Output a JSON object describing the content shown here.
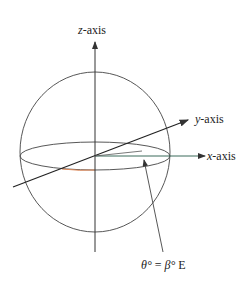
{
  "diagram": {
    "type": "sphere-coordinate-axes",
    "labels": {
      "z_axis_var": "z",
      "z_axis_suffix": "-axis",
      "y_axis_var": "y",
      "y_axis_suffix": "-axis",
      "x_axis_var": "x",
      "x_axis_suffix": "-axis",
      "angle_theta": "θ°",
      "equals": " = ",
      "angle_beta": "β°",
      "east": " E"
    },
    "colors": {
      "line": "#333333",
      "x_axis": "#3a6b5a",
      "equator_highlight": "#e08a5a",
      "background": "#ffffff"
    }
  }
}
